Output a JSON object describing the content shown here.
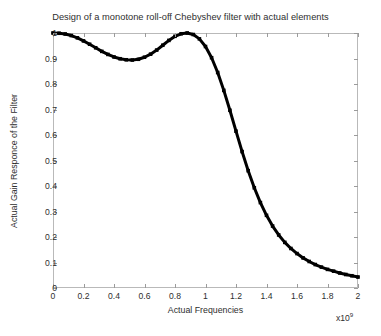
{
  "chart_data": {
    "type": "line",
    "title": "Design of a monotone roll-off Chebyshev filter with actual elements",
    "xlabel": "Actual Frequencies",
    "ylabel": "Actual Gain Responce of the Filter",
    "x_exponent_base": "x10",
    "x_exponent_power": "9",
    "xlim": [
      0,
      2
    ],
    "ylim": [
      0,
      1
    ],
    "xticks": [
      0,
      0.2,
      0.4,
      0.6,
      0.8,
      1,
      1.2,
      1.4,
      1.6,
      1.8,
      2
    ],
    "xticklabels": [
      "0",
      "0.2",
      "0.4",
      "0.6",
      "0.8",
      "1",
      "1.2",
      "1.4",
      "1.6",
      "1.8",
      "2"
    ],
    "yticks": [
      0,
      0.1,
      0.2,
      0.3,
      0.4,
      0.5,
      0.6,
      0.7,
      0.8,
      0.9,
      1
    ],
    "yticklabels": [
      "0",
      "0.1",
      "0.2",
      "0.3",
      "0.4",
      "0.5",
      "0.6",
      "0.7",
      "0.8",
      "0.9",
      "1"
    ],
    "grid": false,
    "legend": null,
    "line_color": "#000000",
    "line_width": 3,
    "marker": "square",
    "series": [
      {
        "name": "Actual gain response",
        "x": [
          0.0,
          0.04,
          0.08,
          0.12,
          0.16,
          0.2,
          0.24,
          0.28,
          0.32,
          0.36,
          0.4,
          0.44,
          0.48,
          0.52,
          0.56,
          0.6,
          0.64,
          0.68,
          0.72,
          0.76,
          0.8,
          0.84,
          0.88,
          0.92,
          0.96,
          1.0,
          1.04,
          1.08,
          1.12,
          1.16,
          1.2,
          1.24,
          1.28,
          1.32,
          1.36,
          1.4,
          1.44,
          1.48,
          1.52,
          1.56,
          1.6,
          1.64,
          1.68,
          1.72,
          1.76,
          1.8,
          1.84,
          1.88,
          1.92,
          1.96,
          2.0
        ],
        "y": [
          1.0,
          0.999,
          0.996,
          0.99,
          0.981,
          0.969,
          0.956,
          0.942,
          0.928,
          0.916,
          0.906,
          0.899,
          0.895,
          0.894,
          0.897,
          0.905,
          0.917,
          0.933,
          0.952,
          0.971,
          0.987,
          0.997,
          1.0,
          0.994,
          0.977,
          0.947,
          0.903,
          0.845,
          0.775,
          0.697,
          0.615,
          0.535,
          0.46,
          0.393,
          0.335,
          0.285,
          0.243,
          0.208,
          0.179,
          0.155,
          0.135,
          0.118,
          0.104,
          0.092,
          0.082,
          0.073,
          0.066,
          0.059,
          0.053,
          0.048,
          0.043
        ]
      }
    ]
  },
  "figure": {
    "background_color": "#ffffff",
    "axis_color": "#b9b9b9",
    "text_color": "#2e2e2e"
  }
}
